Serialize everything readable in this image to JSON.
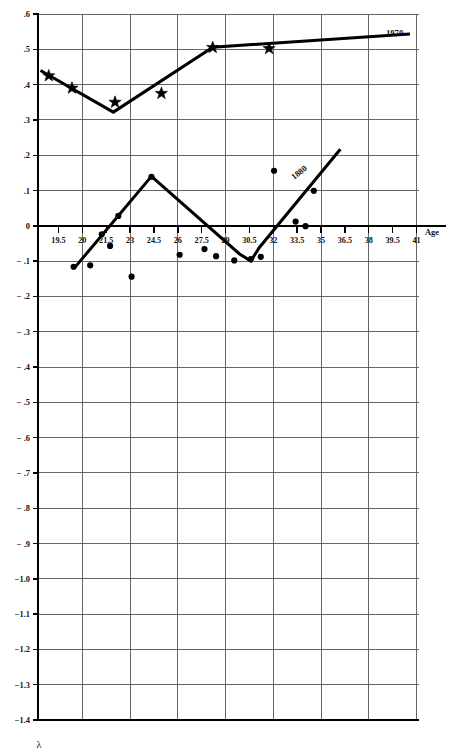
{
  "chart_data": {
    "type": "scatter",
    "title": "",
    "subtitle": "",
    "xlabel": "Age",
    "ylabel": "λ",
    "xlim": [
      18.75,
      41.75
    ],
    "ylim": [
      -1.4,
      0.6
    ],
    "grid": true,
    "legend_position": "inline-curve-labels",
    "x_ticks": [
      "19.5",
      "20",
      "21.5",
      "23",
      "24.5",
      "26",
      "27.5",
      "29",
      "30.5",
      "32",
      "33.5",
      "35",
      "36.5",
      "38",
      "39.5",
      "41"
    ],
    "y_ticks": [
      ".6",
      ".5",
      ".4",
      ".3",
      ".2",
      ".1",
      "0",
      "− .1",
      "− .2",
      "− .3",
      "− .4",
      "− .5",
      "− .6",
      "− .7",
      "− .8",
      "− .9",
      "−1.0",
      "−1.1",
      "−1.2",
      "−1.3",
      "−1.4"
    ],
    "y_tick_values": [
      0.6,
      0.5,
      0.4,
      0.3,
      0.2,
      0.1,
      0.0,
      -0.1,
      -0.2,
      -0.3,
      -0.4,
      -0.5,
      -0.6,
      -0.7,
      -0.8,
      -0.9,
      -1.0,
      -1.1,
      -1.2,
      -1.3,
      -1.4
    ],
    "series": [
      {
        "name": "1970",
        "label": "1970",
        "marker": "star",
        "line": "fitted-piecewise",
        "points": [
          {
            "x": 19.4,
            "y": 0.425
          },
          {
            "x": 20.8,
            "y": 0.39
          },
          {
            "x": 23.4,
            "y": 0.35
          },
          {
            "x": 26.2,
            "y": 0.375
          },
          {
            "x": 29.3,
            "y": 0.505
          },
          {
            "x": 32.7,
            "y": 0.502
          }
        ],
        "line_points": [
          {
            "x": 18.9,
            "y": 0.44
          },
          {
            "x": 23.3,
            "y": 0.322
          },
          {
            "x": 29.3,
            "y": 0.506
          },
          {
            "x": 41.2,
            "y": 0.543
          }
        ]
      },
      {
        "name": "1880",
        "label": "1880",
        "marker": "dot",
        "line": "fitted-piecewise",
        "points": [
          {
            "x": 20.9,
            "y": -0.116
          },
          {
            "x": 21.9,
            "y": -0.112
          },
          {
            "x": 22.6,
            "y": -0.024
          },
          {
            "x": 23.1,
            "y": -0.057
          },
          {
            "x": 23.6,
            "y": 0.028
          },
          {
            "x": 24.4,
            "y": -0.144
          },
          {
            "x": 25.6,
            "y": 0.139
          },
          {
            "x": 27.3,
            "y": -0.082
          },
          {
            "x": 28.8,
            "y": -0.066
          },
          {
            "x": 29.5,
            "y": -0.086
          },
          {
            "x": 30.6,
            "y": -0.098
          },
          {
            "x": 31.6,
            "y": -0.094
          },
          {
            "x": 32.2,
            "y": -0.088
          },
          {
            "x": 33.0,
            "y": 0.156
          },
          {
            "x": 34.3,
            "y": 0.012
          },
          {
            "x": 34.9,
            "y": -0.001
          },
          {
            "x": 35.4,
            "y": 0.099
          }
        ],
        "line_points": [
          {
            "x": 20.9,
            "y": -0.122
          },
          {
            "x": 25.6,
            "y": 0.14
          },
          {
            "x": 30.9,
            "y": -0.079
          },
          {
            "x": 31.6,
            "y": -0.1
          },
          {
            "x": 32.1,
            "y": -0.062
          },
          {
            "x": 37.0,
            "y": 0.217
          }
        ]
      }
    ]
  }
}
